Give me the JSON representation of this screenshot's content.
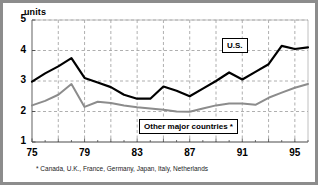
{
  "chart_data": {
    "type": "line",
    "title": "",
    "subtitle": "",
    "ylabel": "units",
    "xlabel": "",
    "ylim": [
      1,
      5
    ],
    "xlim": [
      1975,
      1996
    ],
    "yticks": [
      "1",
      "2",
      "3",
      "4",
      "5"
    ],
    "ytick_values": [
      1,
      2,
      3,
      4,
      5
    ],
    "xticks": [
      "75",
      "79",
      "83",
      "87",
      "91",
      "95"
    ],
    "xtick_values": [
      1975,
      1979,
      1983,
      1987,
      1991,
      1995
    ],
    "grid": true,
    "grid_style": "dashed",
    "legend_position": "inline-boxed-labels",
    "annotations": [
      {
        "text": "* Canada, U.K., France, Germany, Japan, Italy, Netherlands",
        "position": "below-axis"
      }
    ],
    "x": [
      1975,
      1976,
      1977,
      1978,
      1979,
      1980,
      1981,
      1982,
      1983,
      1984,
      1985,
      1986,
      1987,
      1988,
      1989,
      1990,
      1991,
      1992,
      1993,
      1994,
      1995,
      1996
    ],
    "series": [
      {
        "name": "U.S.",
        "color": "#000000",
        "values": [
          2.98,
          3.25,
          3.48,
          3.75,
          3.1,
          2.95,
          2.8,
          2.55,
          2.42,
          2.42,
          2.82,
          2.68,
          2.5,
          2.75,
          3.0,
          3.28,
          3.05,
          3.3,
          3.55,
          4.15,
          4.05,
          4.1
        ]
      },
      {
        "name": "Other major countries *",
        "color": "#8c8c8c",
        "values": [
          2.2,
          2.35,
          2.55,
          2.9,
          2.15,
          2.32,
          2.28,
          2.2,
          2.14,
          2.1,
          2.06,
          2.0,
          1.99,
          2.1,
          2.2,
          2.26,
          2.26,
          2.22,
          2.45,
          2.62,
          2.78,
          2.9
        ]
      }
    ]
  },
  "labels": {
    "units": "units",
    "us": "U.S.",
    "other": "Other major countries *",
    "footnote": "* Canada, U.K., France, Germany, Japan, Italy, Netherlands"
  }
}
